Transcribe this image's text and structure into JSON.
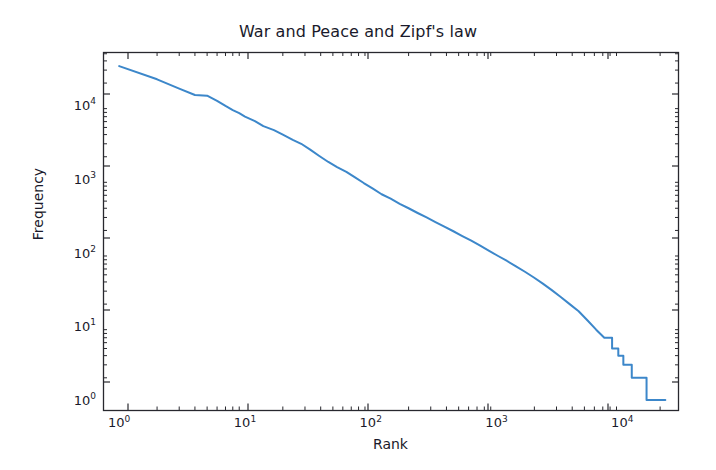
{
  "chart": {
    "title": "War and Peace and Zipf's law",
    "xlabel": "Rank",
    "ylabel": "Frequency"
  },
  "axis": {
    "x_ticks": [
      {
        "label_base": "10",
        "label_exp": "0",
        "value": 1
      },
      {
        "label_base": "10",
        "label_exp": "1",
        "value": 10
      },
      {
        "label_base": "10",
        "label_exp": "2",
        "value": 100
      },
      {
        "label_base": "10",
        "label_exp": "3",
        "value": 1000
      },
      {
        "label_base": "10",
        "label_exp": "4",
        "value": 10000
      }
    ],
    "y_ticks": [
      {
        "label_base": "10",
        "label_exp": "0",
        "value": 1
      },
      {
        "label_base": "10",
        "label_exp": "1",
        "value": 10
      },
      {
        "label_base": "10",
        "label_exp": "2",
        "value": 100
      },
      {
        "label_base": "10",
        "label_exp": "3",
        "value": 1000
      },
      {
        "label_base": "10",
        "label_exp": "4",
        "value": 10000
      }
    ]
  },
  "chart_data": {
    "type": "line",
    "title": "War and Peace and Zipf's law",
    "xlabel": "Rank",
    "ylabel": "Frequency",
    "xscale": "log",
    "yscale": "log",
    "xlim": [
      0.75,
      28000
    ],
    "ylim": [
      0.72,
      52000
    ],
    "grid": false,
    "legend": null,
    "line_color": "#3c87ca",
    "line_width": 2.0,
    "series": [
      {
        "name": "word frequency vs rank",
        "x": [
          1,
          2,
          3,
          4,
          5,
          6,
          7,
          8,
          9,
          10,
          12,
          14,
          17,
          20,
          24,
          28,
          33,
          39,
          46,
          54,
          64,
          75,
          88,
          104,
          122,
          144,
          170,
          200,
          236,
          278,
          327,
          385,
          454,
          535,
          630,
          742,
          874,
          1030,
          1213,
          1429,
          1683,
          1983,
          2336,
          2752,
          3242,
          3819,
          4500,
          5300,
          6200,
          7200,
          8300,
          9300,
          10200,
          10900,
          11400,
          11900,
          12400,
          12900,
          13400,
          13900,
          14300,
          14700,
          15100,
          15600,
          16100,
          16800,
          17600,
          18600,
          19700,
          20900,
          22000
        ],
        "y": [
          34000,
          22500,
          16800,
          13800,
          13500,
          11500,
          9800,
          8600,
          7800,
          7000,
          6100,
          5200,
          4600,
          4000,
          3400,
          3000,
          2500,
          2050,
          1700,
          1450,
          1250,
          1050,
          880,
          740,
          620,
          540,
          460,
          400,
          345,
          300,
          260,
          225,
          195,
          168,
          145,
          124,
          106,
          90,
          77,
          65,
          55,
          46,
          38,
          31,
          25,
          20,
          16,
          12,
          9,
          7,
          5,
          4,
          3,
          3,
          3,
          2,
          2,
          2,
          2,
          2,
          2,
          2,
          2,
          1,
          1,
          1,
          1,
          1,
          1,
          1,
          1
        ]
      }
    ]
  }
}
